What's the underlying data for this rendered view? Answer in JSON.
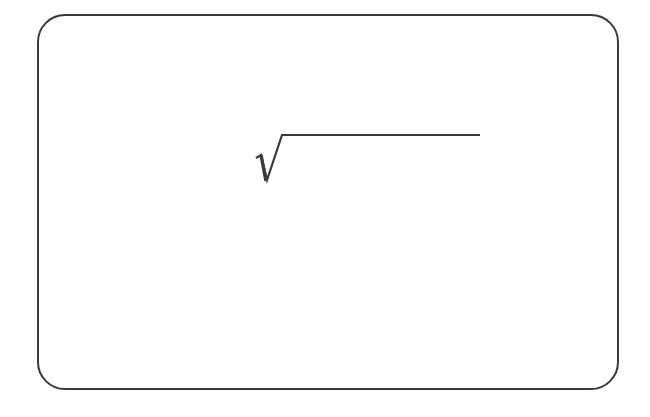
{
  "diagram": {
    "symbol": "square-root",
    "symbol_label": "√",
    "radicand": "",
    "colors": {
      "stroke": "#3a3a3a",
      "background": "#ffffff"
    }
  }
}
